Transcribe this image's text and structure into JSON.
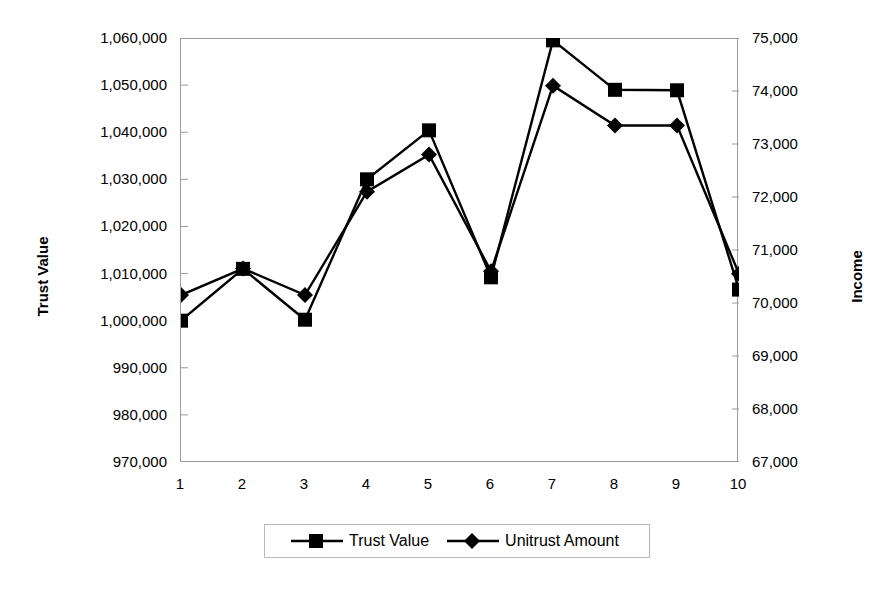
{
  "chart_data": {
    "type": "line",
    "title": "",
    "xlabel": "",
    "categories": [
      "1",
      "2",
      "3",
      "4",
      "5",
      "6",
      "7",
      "8",
      "9",
      "10"
    ],
    "grid": false,
    "legend_position": "bottom",
    "axes": {
      "left": {
        "label": "Trust Value",
        "ticks": [
          "970,000",
          "980,000",
          "990,000",
          "1,000,000",
          "1,010,000",
          "1,020,000",
          "1,030,000",
          "1,040,000",
          "1,050,000",
          "1,060,000"
        ],
        "tick_values": [
          970000,
          980000,
          990000,
          1000000,
          1010000,
          1020000,
          1030000,
          1040000,
          1050000,
          1060000
        ],
        "min": 970000,
        "max": 1060000,
        "step": 10000
      },
      "right": {
        "label": "Income",
        "ticks": [
          "67,000",
          "68,000",
          "69,000",
          "70,000",
          "71,000",
          "72,000",
          "73,000",
          "74,000",
          "75,000"
        ],
        "tick_values": [
          67000,
          68000,
          69000,
          70000,
          71000,
          72000,
          73000,
          74000,
          75000
        ],
        "min": 67000,
        "max": 75000,
        "step": 1000
      }
    },
    "series": [
      {
        "name": "Trust Value",
        "marker": "square",
        "axis": "left",
        "color": "#000000",
        "values": [
          1000000,
          1011000,
          1000200,
          1030000,
          1040400,
          1009200,
          1059500,
          1049000,
          1048900,
          1006600
        ]
      },
      {
        "name": "Unitrust Amount",
        "marker": "diamond",
        "axis": "right",
        "color": "#000000",
        "values": [
          70150,
          70650,
          70150,
          72100,
          72800,
          70600,
          74100,
          73350,
          73350,
          70550
        ]
      }
    ]
  },
  "legend": {
    "items": [
      {
        "label": "Trust Value",
        "marker": "square"
      },
      {
        "label": "Unitrust Amount",
        "marker": "diamond"
      }
    ]
  },
  "icons": {
    "square_marker": "square-marker-icon",
    "diamond_marker": "diamond-marker-icon"
  }
}
